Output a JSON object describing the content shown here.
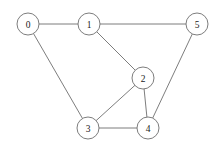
{
  "figure": {
    "kind": "undirected-graph-drawing",
    "width": 218,
    "height": 146,
    "background_color": "#ffffff",
    "stroke_color": "#6e6e6e",
    "label_color": "#1a1a1a",
    "node_fill_color": "#ffffff",
    "node_radius": 11
  },
  "nodes": [
    {
      "id": "0",
      "label": "0",
      "x": 28,
      "y": 24
    },
    {
      "id": "1",
      "label": "1",
      "x": 89,
      "y": 24
    },
    {
      "id": "2",
      "label": "2",
      "x": 143,
      "y": 78
    },
    {
      "id": "3",
      "label": "3",
      "x": 88,
      "y": 128
    },
    {
      "id": "4",
      "label": "4",
      "x": 148,
      "y": 128
    },
    {
      "id": "5",
      "label": "5",
      "x": 197,
      "y": 24
    }
  ],
  "edges": [
    {
      "source": "0",
      "target": "1"
    },
    {
      "source": "0",
      "target": "3"
    },
    {
      "source": "1",
      "target": "2"
    },
    {
      "source": "1",
      "target": "5"
    },
    {
      "source": "2",
      "target": "3"
    },
    {
      "source": "2",
      "target": "4"
    },
    {
      "source": "3",
      "target": "4"
    },
    {
      "source": "4",
      "target": "5"
    }
  ]
}
